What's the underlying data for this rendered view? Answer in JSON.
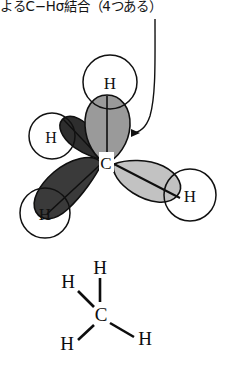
{
  "caption": {
    "text": "よるC−Hσ結合（4つある）"
  },
  "orbital_diagram": {
    "center_atom": "C",
    "hydrogen_labels": {
      "top": "H",
      "upper_left": "H",
      "lower_left": "H",
      "right": "H"
    },
    "colors": {
      "lobe_top": "#9a9a9a",
      "lobe_upper_left": "#2e2e2e",
      "lobe_lower_left": "#3a3a3a",
      "lobe_right": "#c2c2c2",
      "outline": "#111111",
      "circle_fill": "#ffffff"
    },
    "leader_line": {
      "present": true,
      "arrowhead": "left"
    }
  },
  "lewis_structure": {
    "center_atom": "C",
    "hydrogen_labels": {
      "top": "H",
      "left": "H",
      "bottom_left": "H",
      "right": "H"
    },
    "bond_count": 4,
    "color": "#0d0d0d"
  }
}
